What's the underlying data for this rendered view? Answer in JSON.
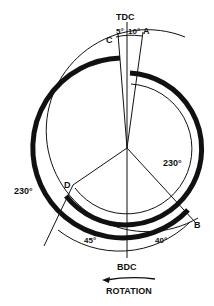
{
  "diagram": {
    "labels": {
      "tdc": "TDC",
      "bdc": "BDC",
      "rotation": "ROTATION",
      "point_a": "A",
      "point_b": "B",
      "point_c": "C",
      "point_d": "D"
    },
    "angles": {
      "c_to_tdc": "5°",
      "tdc_to_a": "10°",
      "bdc_to_b": "40°",
      "d_to_bdc": "45°",
      "outer_duration": "230°",
      "inner_duration": "230°"
    },
    "colors": {
      "ink": "#111111",
      "background": "#ffffff"
    }
  }
}
